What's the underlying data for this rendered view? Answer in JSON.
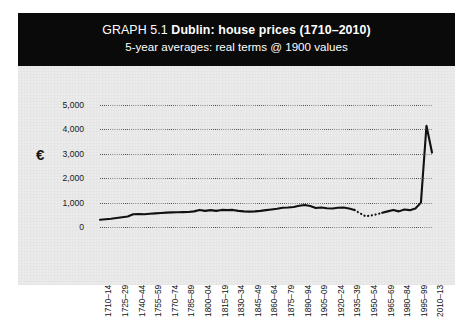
{
  "figure": {
    "header": {
      "graph_number": "GRAPH 5.1",
      "title": "Dublin: house prices (1710–2010)",
      "subtitle": "5-year averages: real terms @ 1900 values"
    },
    "currency_symbol": "€"
  },
  "chart_data": {
    "type": "line",
    "title": "Dublin: house prices (1710–2010)",
    "subtitle": "5-year averages: real terms @ 1900 values",
    "xlabel": "",
    "ylabel": "€",
    "ylim": [
      0,
      5000
    ],
    "yticks": [
      0,
      1000,
      2000,
      3000,
      4000,
      5000
    ],
    "ytick_labels": [
      "0",
      "1,000",
      "2,000",
      "3,000",
      "4,000",
      "5,000"
    ],
    "grid": "horizontal-dotted",
    "legend": "none",
    "line_color": "#111111",
    "categories": [
      "1710–14",
      "1715–19",
      "1720–24",
      "1725–29",
      "1730–34",
      "1735–39",
      "1740–44",
      "1745–49",
      "1750–54",
      "1755–59",
      "1760–64",
      "1765–69",
      "1770–74",
      "1775–79",
      "1780–84",
      "1785–89",
      "1790–94",
      "1795–99",
      "1800–04",
      "1805–09",
      "1810–14",
      "1815–19",
      "1820–24",
      "1825–29",
      "1830–34",
      "1835–39",
      "1840–44",
      "1845–49",
      "1850–54",
      "1855–59",
      "1860–64",
      "1865–69",
      "1870–74",
      "1875–79",
      "1880–84",
      "1885–89",
      "1890–94",
      "1895–99",
      "1900–04",
      "1905–09",
      "1910–14",
      "1915–19",
      "1920–24",
      "1925–29",
      "1930–34",
      "1935–39",
      "1940–44",
      "1945–49",
      "1950–54",
      "1955–59",
      "1960–64",
      "1965–69",
      "1970–74",
      "1975–79",
      "1980–84",
      "1985–89",
      "1990–94",
      "1995–99",
      "2000–04",
      "2005–09",
      "2010–13"
    ],
    "xtick_labels_shown": [
      "1710–14",
      "1725–29",
      "1740–44",
      "1755–59",
      "1770–74",
      "1785–89",
      "1800–04",
      "1815–19",
      "1830–34",
      "1845–49",
      "1860–64",
      "1875–79",
      "1890–94",
      "1905–09",
      "1920–24",
      "1935–39",
      "1950–54",
      "1965–69",
      "1980–84",
      "1995–99",
      "2010–13"
    ],
    "xtick_label_interval": 3,
    "values": [
      300,
      320,
      340,
      370,
      400,
      430,
      520,
      530,
      525,
      540,
      560,
      575,
      590,
      600,
      605,
      610,
      615,
      640,
      700,
      660,
      690,
      660,
      700,
      690,
      700,
      660,
      640,
      630,
      640,
      660,
      690,
      720,
      750,
      790,
      800,
      820,
      870,
      900,
      860,
      780,
      800,
      770,
      760,
      790,
      800,
      760,
      700,
      560,
      440,
      470,
      520,
      580,
      640,
      700,
      640,
      720,
      690,
      760,
      1000,
      4150,
      3050
    ],
    "estimated_segment": {
      "note": "dotted — interpolated / missing data",
      "start_category": "1940–44",
      "end_category": "1965–69"
    }
  }
}
